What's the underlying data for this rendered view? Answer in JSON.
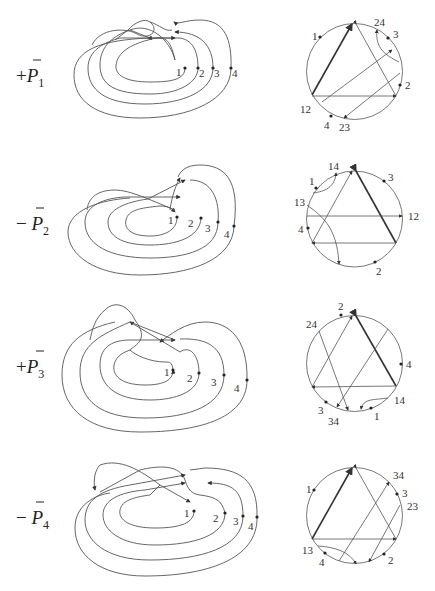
{
  "rows": [
    {
      "sign": "+",
      "label": "P",
      "subscript": "1",
      "curve_labels": [
        "1",
        "2",
        "3",
        "4"
      ],
      "chord_labels": {
        "a": "1",
        "b": "24",
        "c": "3",
        "d": "2",
        "e": "12",
        "f": "4",
        "g": "23"
      }
    },
    {
      "sign": "−",
      "label": "P",
      "subscript": "2",
      "curve_labels": [
        "1",
        "2",
        "3",
        "4"
      ],
      "chord_labels": {
        "a": "14",
        "b": "1",
        "c": "3",
        "d": "13",
        "e": "12",
        "f": "4",
        "g": "2"
      }
    },
    {
      "sign": "+",
      "label": "P",
      "subscript": "3",
      "curve_labels": [
        "1",
        "2",
        "3",
        "4"
      ],
      "chord_labels": {
        "a": "2",
        "b": "24",
        "c": "4",
        "d": "14",
        "e": "3",
        "f": "34",
        "g": "1"
      }
    },
    {
      "sign": "−",
      "label": "P",
      "subscript": "4",
      "curve_labels": [
        "1",
        "2",
        "3",
        "4"
      ],
      "chord_labels": {
        "a": "34",
        "b": "1",
        "c": "3",
        "d": "23",
        "e": "13",
        "f": "4",
        "g": "2"
      }
    }
  ],
  "colors": {
    "stroke": "#555555",
    "background": "#ffffff"
  }
}
